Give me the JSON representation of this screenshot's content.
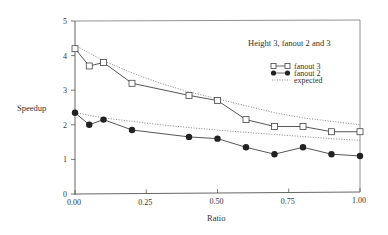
{
  "chart_data": {
    "type": "line",
    "title": "Height 3, fanout 2 and 3",
    "xlabel": "Ratio",
    "ylabel": "Speedup",
    "xlim": [
      0,
      1
    ],
    "ylim": [
      0,
      5
    ],
    "grid": false,
    "legend_position": "upper right (inside)",
    "x_ticks": [
      "0.00",
      "0.25",
      "0.50",
      "0.75",
      "1.00"
    ],
    "y_ticks": [
      "0",
      "1",
      "2",
      "3",
      "4",
      "5"
    ],
    "x": [
      0.0,
      0.05,
      0.1,
      0.2,
      0.4,
      0.5,
      0.6,
      0.7,
      0.8,
      0.9,
      1.0
    ],
    "series": [
      {
        "name": "fanout 3",
        "marker": "open-square",
        "line": "solid",
        "values": [
          4.2,
          3.7,
          3.8,
          3.2,
          2.85,
          2.7,
          2.15,
          1.95,
          1.95,
          1.8,
          1.8
        ]
      },
      {
        "name": "fanout 2",
        "marker": "filled-circle",
        "line": "solid",
        "values": [
          2.35,
          2.0,
          2.15,
          1.85,
          1.65,
          1.6,
          1.35,
          1.15,
          1.35,
          1.15,
          1.1
        ]
      },
      {
        "name": "expected",
        "marker": "none",
        "line": "dotted",
        "curves": [
          {
            "x": [
              0.0,
              0.1,
              0.2,
              0.3,
              0.4,
              0.5,
              0.6,
              0.7,
              0.8,
              0.9,
              1.0
            ],
            "values": [
              4.3,
              3.85,
              3.5,
              3.2,
              2.95,
              2.75,
              2.55,
              2.35,
              2.2,
              2.1,
              2.0
            ]
          },
          {
            "x": [
              0.0,
              0.1,
              0.2,
              0.3,
              0.4,
              0.5,
              0.6,
              0.7,
              0.8,
              0.9,
              1.0
            ],
            "values": [
              2.35,
              2.2,
              2.1,
              2.0,
              1.92,
              1.85,
              1.78,
              1.72,
              1.66,
              1.6,
              1.55
            ]
          }
        ]
      }
    ]
  },
  "labels": {
    "title": "Height 3, fanout 2 and 3",
    "xlabel": "Ratio",
    "ylabel": "Speedup",
    "legend": [
      "fanout 3",
      "fanout 2",
      "expected"
    ]
  }
}
